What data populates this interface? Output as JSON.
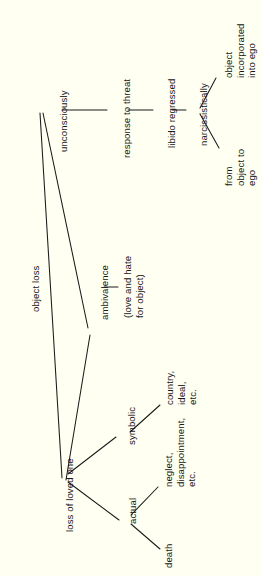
{
  "diagram": {
    "title": "object loss",
    "type": "tree-diagram",
    "orientation": "rotated-90-ccw",
    "background_color": "#fffff2",
    "line_color": "#1a1a1a",
    "text_color": "#161616",
    "nodes": [
      {
        "id": "object-loss",
        "label": "object loss"
      },
      {
        "id": "unconsciously",
        "label": "unconsciously"
      },
      {
        "id": "response-to-threat",
        "label": "response to threat"
      },
      {
        "id": "libido-regressed",
        "label": "libido regressed"
      },
      {
        "id": "narcissistically",
        "label": "narcissistically"
      },
      {
        "id": "object-incorporated",
        "label": "object incorporated\ninto ego"
      },
      {
        "id": "from-object-to-ego",
        "label": "from object to\nego"
      },
      {
        "id": "ambivalence",
        "label": "ambivalence"
      },
      {
        "id": "love-and-hate",
        "label": "(love and hate\nfor object)"
      },
      {
        "id": "loss-of-loved-one",
        "label": "loss of loved one"
      },
      {
        "id": "symbolic",
        "label": "symbolic"
      },
      {
        "id": "symbolic-examples",
        "label": "country,\nideal,\netc."
      },
      {
        "id": "actual",
        "label": "actual"
      },
      {
        "id": "actual-examples",
        "label": "neglect,\ndisappointment,\netc."
      },
      {
        "id": "death",
        "label": "death"
      }
    ],
    "edges": [
      {
        "from": "unconsciously",
        "to": "response-to-threat"
      },
      {
        "from": "response-to-threat",
        "to": "libido-regressed"
      },
      {
        "from": "libido-regressed",
        "to": "narcissistically"
      },
      {
        "from": "narcissistically",
        "to": "object-incorporated"
      },
      {
        "from": "narcissistically",
        "to": "from-object-to-ego"
      },
      {
        "from": "unconsciously",
        "to": "loss-of-loved-one"
      },
      {
        "from": "ambivalence",
        "to": "loss-of-loved-one"
      },
      {
        "from": "ambivalence",
        "to": "love-and-hate"
      },
      {
        "from": "loss-of-loved-one",
        "to": "symbolic"
      },
      {
        "from": "loss-of-loved-one",
        "to": "actual"
      },
      {
        "from": "symbolic",
        "to": "symbolic-examples"
      },
      {
        "from": "actual",
        "to": "actual-examples"
      },
      {
        "from": "actual",
        "to": "death"
      }
    ]
  }
}
